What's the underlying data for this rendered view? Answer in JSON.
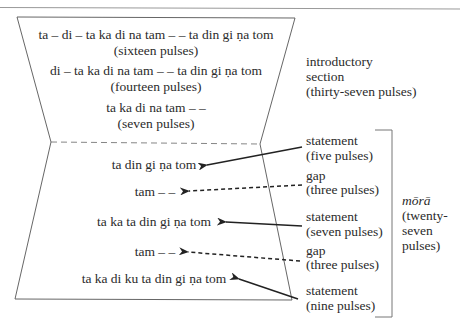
{
  "intro": {
    "lines": [
      {
        "syllables": "ta – di – ta ka di na tam – – ta din gi ṇa tom",
        "pulses": "(sixteen pulses)"
      },
      {
        "syllables": "di – ta ka di na tam – – ta din gi ṇa tom",
        "pulses": "(fourteen pulses)"
      },
      {
        "syllables": "ta ka di na tam – –",
        "pulses": "(seven pulses)"
      }
    ],
    "label": [
      "introductory",
      "section",
      "(thirty-seven pulses)"
    ]
  },
  "mora": {
    "lines": [
      {
        "syllables": "ta din gi ṇa tom",
        "type": "statement",
        "pulses": "(five pulses)",
        "arrow": "solid"
      },
      {
        "syllables": "tam – –",
        "type": "gap",
        "pulses": "(three pulses)",
        "arrow": "dashed"
      },
      {
        "syllables": "ta ka ta din gi ṇa tom",
        "type": "statement",
        "pulses": "(seven pulses)",
        "arrow": "solid"
      },
      {
        "syllables": "tam – –",
        "type": "gap",
        "pulses": "(three pulses)",
        "arrow": "dashed"
      },
      {
        "syllables": "ta ka di ku ta din gi ṇa tom",
        "type": "statement",
        "pulses": "(nine pulses)",
        "arrow": "solid"
      }
    ],
    "label": {
      "title": "mōrā",
      "lines": [
        "(twenty-",
        "seven",
        "pulses)"
      ]
    }
  },
  "colors": {
    "line": "#555555",
    "arrow": "#222222",
    "text": "#2b2b2b"
  }
}
